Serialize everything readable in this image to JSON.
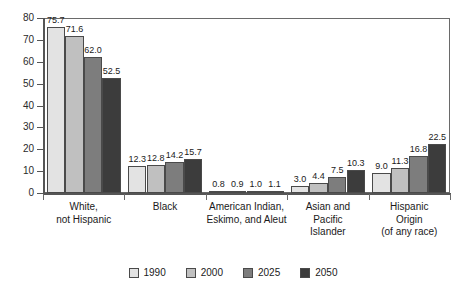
{
  "chart_data": {
    "type": "bar",
    "title": "",
    "subtitle": "",
    "xlabel": "",
    "ylabel": "",
    "ylim": [
      0,
      80
    ],
    "ytick_values": [
      0,
      10,
      20,
      30,
      40,
      50,
      60,
      70,
      80
    ],
    "ytick_labels": [
      "0",
      "10",
      "20",
      "30",
      "40",
      "50",
      "60",
      "70",
      "80"
    ],
    "grid": false,
    "legend_position": "bottom-center",
    "categories": [
      "White,\nnot Hispanic",
      "Black",
      "American Indian,\nEskimo, and Aleut",
      "Asian and\nPacific\nIslander",
      "Hispanic\nOrigin\n(of any race)"
    ],
    "category_lines": [
      [
        "White,",
        "not Hispanic"
      ],
      [
        "Black"
      ],
      [
        "American Indian,",
        "Eskimo, and Aleut"
      ],
      [
        "Asian and",
        "Pacific",
        "Islander"
      ],
      [
        "Hispanic",
        "Origin",
        "(of any race)"
      ]
    ],
    "series": [
      {
        "name": "1990",
        "color": "#e3e3e3",
        "values": [
          75.7,
          12.3,
          0.8,
          3.0,
          9.0
        ],
        "labels": [
          "75.7",
          "12.3",
          "0.8",
          "3.0",
          "9.0"
        ]
      },
      {
        "name": "2000",
        "color": "#c0c0c0",
        "values": [
          71.6,
          12.8,
          0.9,
          4.4,
          11.3
        ],
        "labels": [
          "71.6",
          "12.8",
          "0.9",
          "4.4",
          "11.3"
        ]
      },
      {
        "name": "2025",
        "color": "#7d7d7d",
        "values": [
          62.0,
          14.2,
          1.0,
          7.5,
          16.8
        ],
        "labels": [
          "62.0",
          "14.2",
          "1.0",
          "7.5",
          "16.8"
        ]
      },
      {
        "name": "2050",
        "color": "#3c3c3c",
        "values": [
          52.5,
          15.7,
          1.1,
          10.3,
          22.5
        ],
        "labels": [
          "52.5",
          "15.7",
          "1.1",
          "10.3",
          "22.5"
        ]
      }
    ],
    "legend_entries": [
      {
        "label": "1990",
        "color": "#e3e3e3"
      },
      {
        "label": "2000",
        "color": "#c0c0c0"
      },
      {
        "label": "2025",
        "color": "#7d7d7d"
      },
      {
        "label": "2050",
        "color": "#3c3c3c"
      }
    ]
  }
}
